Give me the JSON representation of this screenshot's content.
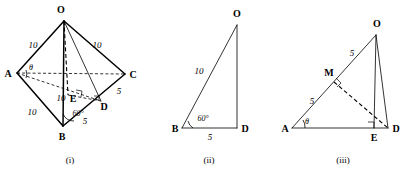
{
  "page": {
    "background": "#ffffff",
    "ink": "#000000",
    "width": 411,
    "height": 179
  },
  "figures": [
    {
      "id": "figure-i",
      "caption": "(i)",
      "description": "pyramid-OABCD",
      "vertices": {
        "O": "O",
        "A": "A",
        "B": "B",
        "C": "C",
        "D": "D",
        "E": "E"
      },
      "measures": {
        "OA": "10",
        "OC": "10",
        "OB": "10",
        "AB": "10",
        "BD": "5",
        "DC": "5"
      },
      "angles": {
        "at_A": "θ",
        "at_B": "60°"
      },
      "right_angle_marks": [
        "at-A-foot",
        "at-E",
        "at-D"
      ]
    },
    {
      "id": "figure-ii",
      "caption": "(ii)",
      "description": "right-triangle-BDO",
      "vertices": {
        "O": "O",
        "B": "B",
        "D": "D"
      },
      "measures": {
        "BO": "10",
        "BD": "5"
      },
      "angles": {
        "at_B": "60°"
      },
      "right_angle_marks": []
    },
    {
      "id": "figure-iii",
      "caption": "(iii)",
      "description": "triangle-AOD-with-midpoint-M",
      "vertices": {
        "O": "O",
        "A": "A",
        "D": "D",
        "E": "E",
        "M": "M"
      },
      "measures": {
        "MO": "5",
        "AM": "5"
      },
      "angles": {
        "at_A": "θ"
      },
      "right_angle_marks": [
        "at-M",
        "at-E"
      ]
    }
  ]
}
